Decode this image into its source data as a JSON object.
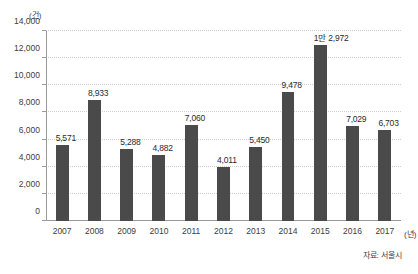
{
  "chart_data": {
    "type": "bar",
    "title": "",
    "xlabel": "(년)",
    "ylabel": "(건)",
    "unit_label": "(건)",
    "categories": [
      "2007",
      "2008",
      "2009",
      "2010",
      "2011",
      "2012",
      "2013",
      "2014",
      "2015",
      "2016",
      "2017"
    ],
    "values": [
      5571,
      8933,
      5288,
      4882,
      7060,
      4011,
      5450,
      9478,
      12972,
      7029,
      6703
    ],
    "value_labels": [
      "5,571",
      "8,933",
      "5,288",
      "4,882",
      "7,060",
      "4,011",
      "5,450",
      "9,478",
      "1만 2,972",
      "7,029",
      "6,703"
    ],
    "ylim": [
      0,
      14000
    ],
    "ytick_values": [
      0,
      2000,
      4000,
      6000,
      8000,
      10000,
      12000,
      14000
    ],
    "ytick_labels": [
      "0",
      "2,000",
      "4,000",
      "6,000",
      "8,000",
      "10,000",
      "12,000",
      "14,000"
    ],
    "grid": true,
    "legend": false,
    "bar_color": "#4a4a4a",
    "gridline_color": "#cfcfcf",
    "axis_color": "#9a9a9a",
    "source_note": "자료: 서울시"
  }
}
